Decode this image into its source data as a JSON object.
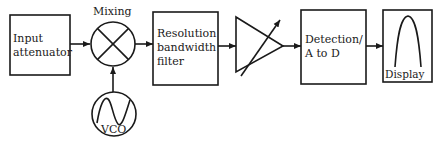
{
  "diagram": {
    "type": "block-diagram",
    "blocks": [
      {
        "id": "input",
        "line1": "Input",
        "line2": "attenuator"
      },
      {
        "id": "mixer",
        "label": "Mixing"
      },
      {
        "id": "vco",
        "label": "VCO"
      },
      {
        "id": "rbw",
        "line1": "Resolution",
        "line2": "bandwidth",
        "line3": "filter"
      },
      {
        "id": "amp",
        "label": "variable-gain amplifier"
      },
      {
        "id": "detect",
        "line1": "Detection/",
        "line2": "A to D"
      },
      {
        "id": "display",
        "label": "Display"
      }
    ],
    "connections": [
      {
        "from": "input",
        "to": "mixer"
      },
      {
        "from": "vco",
        "to": "mixer"
      },
      {
        "from": "mixer",
        "to": "rbw"
      },
      {
        "from": "rbw",
        "to": "amp"
      },
      {
        "from": "amp",
        "to": "detect"
      },
      {
        "from": "detect",
        "to": "display"
      }
    ],
    "colors": {
      "stroke": "#1a1a1a",
      "background": "#ffffff"
    }
  }
}
